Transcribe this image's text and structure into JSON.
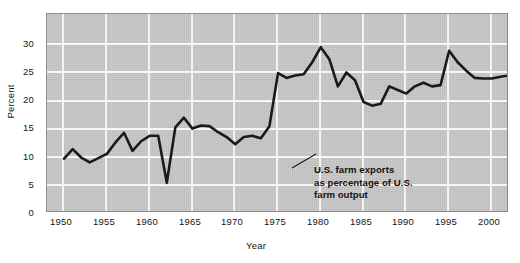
{
  "chart_data": {
    "type": "line",
    "title": "",
    "xlabel": "Year",
    "ylabel": "Percent",
    "xlim": [
      1948,
      2002
    ],
    "ylim": [
      0,
      33
    ],
    "xticks": [
      1950,
      1955,
      1960,
      1965,
      1970,
      1975,
      1980,
      1985,
      1990,
      1995,
      2000
    ],
    "yticks": [
      0,
      5,
      10,
      15,
      20,
      25,
      30
    ],
    "grid": true,
    "legend": null,
    "series": [
      {
        "name": "U.S. farm exports as percentage of U.S. farm output",
        "x": [
          1950,
          1951,
          1952,
          1953,
          1954,
          1955,
          1956,
          1957,
          1958,
          1959,
          1960,
          1961,
          1962,
          1963,
          1964,
          1965,
          1966,
          1967,
          1968,
          1969,
          1970,
          1971,
          1972,
          1973,
          1974,
          1975,
          1976,
          1977,
          1978,
          1979,
          1980,
          1981,
          1982,
          1983,
          1984,
          1985,
          1986,
          1987,
          1988,
          1989,
          1990,
          1991,
          1992,
          1993,
          1994,
          1995,
          1996,
          1997,
          1998,
          1999,
          2000,
          2001,
          2002
        ],
        "values": [
          9.0,
          10.6,
          9.2,
          8.4,
          9.1,
          9.8,
          11.7,
          13.3,
          10.3,
          11.9,
          12.8,
          12.8,
          5.0,
          14.2,
          15.8,
          14.0,
          14.5,
          14.4,
          13.4,
          12.6,
          11.4,
          12.6,
          12.8,
          12.4,
          14.4,
          23.2,
          22.4,
          22.8,
          23.0,
          25.0,
          27.5,
          25.5,
          21.0,
          23.3,
          22.0,
          18.4,
          17.8,
          18.1,
          21.0,
          20.4,
          19.8,
          21.0,
          21.6,
          21.0,
          21.2,
          26.9,
          25.0,
          23.6,
          22.4,
          22.3,
          22.3,
          22.6,
          22.8
        ]
      }
    ],
    "annotations": [
      {
        "text": "U.S. farm exports\nas percentage of U.S.\nfarm output",
        "points_to_year": 1972,
        "points_to_value": 12.8
      }
    ],
    "style": {
      "plot_background": "#c9c9c9",
      "grid_color": "#f4f4f4",
      "line_color": "#1a1a1a",
      "axis_color": "#8c8c8c",
      "page_background": "#ffffff"
    }
  },
  "labels": {
    "y_axis_title": "Percent",
    "x_axis_title": "Year",
    "yticks": [
      "0",
      "5",
      "10",
      "15",
      "20",
      "25",
      "30"
    ],
    "xticks": [
      "1950",
      "1955",
      "1960",
      "1965",
      "1970",
      "1975",
      "1980",
      "1985",
      "1990",
      "1995",
      "2000"
    ],
    "annotation": "U.S. farm exports\nas percentage of U.S.\nfarm output"
  }
}
